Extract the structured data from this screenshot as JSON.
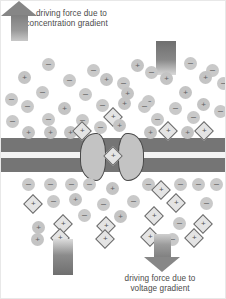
{
  "figure": {
    "labels": {
      "top": {
        "line1": "driving force due to",
        "line2_prefix": "K",
        "line2_superscript": "+",
        "line2_rest": " concentration gradient"
      },
      "bottom": {
        "line1": "driving force due to",
        "line2": "voltage gradient"
      }
    },
    "colors": {
      "membrane": "#757575",
      "membrane_gap": "#f4f4f4",
      "protein_lobe": "#c3c3c3",
      "protein_outline": "#4a4a4a",
      "arrow": "#878787",
      "negative_ion": "#c9c9c9",
      "positive_ion": "#c4c4c4",
      "potassium_ion": "#e4e4e4",
      "text": "#4b4b4b",
      "background": "#ffffff"
    },
    "arrows": [
      {
        "name": "concentration-gradient-arrow",
        "direction": "up",
        "position": "top-left",
        "x": 50,
        "y": 39
      },
      {
        "name": "concentration-gradient-tail",
        "direction": "up",
        "position": "top-right",
        "x": 155,
        "y": 40
      },
      {
        "name": "voltage-gradient-tail",
        "direction": "down",
        "position": "bottom-left",
        "x": 52,
        "y": 238
      },
      {
        "name": "voltage-gradient-arrow",
        "direction": "down",
        "position": "bottom-right",
        "x": 142,
        "y": 233
      }
    ],
    "membrane": {
      "name": "lipid-bilayer",
      "top": 137,
      "height": 36,
      "leaflet_height": 14
    },
    "channel": {
      "name": "potassium-channel-protein",
      "left_lobe": {
        "x": 79,
        "y": 132,
        "w": 26,
        "h": 48
      },
      "right_lobe": {
        "x": 117,
        "y": 132,
        "w": 26,
        "h": 48
      },
      "pore_center_x": 111
    },
    "ion_glyphs": {
      "negative": "–",
      "positive": "+",
      "potassium": "+"
    },
    "ion_legend": [
      {
        "type": "negative",
        "shape": "circle",
        "sign": "–",
        "meaning": "anion"
      },
      {
        "type": "positive",
        "shape": "circle",
        "sign": "+",
        "meaning": "cation"
      },
      {
        "type": "potassium",
        "shape": "diamond",
        "sign": "+",
        "meaning": "K+ ion"
      }
    ],
    "ions": [
      {
        "t": "neg",
        "x": 41,
        "y": 57
      },
      {
        "t": "neg",
        "x": 86,
        "y": 63
      },
      {
        "t": "pos",
        "x": 130,
        "y": 58
      },
      {
        "t": "neg",
        "x": 144,
        "y": 65
      },
      {
        "t": "neg",
        "x": 183,
        "y": 56
      },
      {
        "t": "neg",
        "x": 205,
        "y": 63
      },
      {
        "t": "pos",
        "x": 17,
        "y": 70
      },
      {
        "t": "neg",
        "x": 62,
        "y": 73
      },
      {
        "t": "pos",
        "x": 99,
        "y": 72
      },
      {
        "t": "neg",
        "x": 116,
        "y": 76
      },
      {
        "t": "pos",
        "x": 159,
        "y": 71
      },
      {
        "t": "pos",
        "x": 198,
        "y": 70
      },
      {
        "t": "neg",
        "x": 216,
        "y": 76
      },
      {
        "t": "neg",
        "x": 35,
        "y": 85
      },
      {
        "t": "neg",
        "x": 78,
        "y": 87
      },
      {
        "t": "pos",
        "x": 120,
        "y": 86
      },
      {
        "t": "pos",
        "x": 178,
        "y": 85
      },
      {
        "t": "neg",
        "x": 4,
        "y": 92
      },
      {
        "t": "neg",
        "x": 141,
        "y": 94
      },
      {
        "t": "neg",
        "x": 20,
        "y": 99
      },
      {
        "t": "pos",
        "x": 57,
        "y": 101
      },
      {
        "t": "neg",
        "x": 95,
        "y": 98
      },
      {
        "t": "pos",
        "x": 117,
        "y": 96
      },
      {
        "t": "neg",
        "x": 137,
        "y": 99
      },
      {
        "t": "neg",
        "x": 168,
        "y": 101
      },
      {
        "t": "pos",
        "x": 196,
        "y": 97
      },
      {
        "t": "neg",
        "x": 213,
        "y": 104
      },
      {
        "t": "neg",
        "x": 41,
        "y": 112
      },
      {
        "t": "neg",
        "x": 75,
        "y": 113
      },
      {
        "t": "kion",
        "x": 105,
        "y": 109
      },
      {
        "t": "neg",
        "x": 150,
        "y": 112
      },
      {
        "t": "neg",
        "x": 186,
        "y": 110
      },
      {
        "t": "neg",
        "x": 5,
        "y": 114
      },
      {
        "t": "pos",
        "x": 21,
        "y": 125
      },
      {
        "t": "pos",
        "x": 43,
        "y": 125
      },
      {
        "t": "pos",
        "x": 63,
        "y": 125
      },
      {
        "t": "kion",
        "x": 74,
        "y": 123
      },
      {
        "t": "neg",
        "x": 93,
        "y": 120
      },
      {
        "t": "pos",
        "x": 112,
        "y": 118
      },
      {
        "t": "pos",
        "x": 143,
        "y": 125
      },
      {
        "t": "kion",
        "x": 160,
        "y": 123
      },
      {
        "t": "pos",
        "x": 180,
        "y": 125
      },
      {
        "t": "kion",
        "x": 196,
        "y": 123
      },
      {
        "t": "kion",
        "x": 105,
        "y": 148
      },
      {
        "t": "neg",
        "x": 21,
        "y": 177
      },
      {
        "t": "neg",
        "x": 43,
        "y": 177
      },
      {
        "t": "neg",
        "x": 64,
        "y": 177
      },
      {
        "t": "neg",
        "x": 82,
        "y": 177
      },
      {
        "t": "pos",
        "x": 105,
        "y": 181
      },
      {
        "t": "neg",
        "x": 141,
        "y": 177
      },
      {
        "t": "kion",
        "x": 153,
        "y": 182
      },
      {
        "t": "neg",
        "x": 173,
        "y": 177
      },
      {
        "t": "neg",
        "x": 191,
        "y": 177
      },
      {
        "t": "neg",
        "x": 209,
        "y": 177
      },
      {
        "t": "kion",
        "x": 25,
        "y": 196
      },
      {
        "t": "neg",
        "x": 46,
        "y": 194
      },
      {
        "t": "pos",
        "x": 68,
        "y": 192
      },
      {
        "t": "neg",
        "x": 96,
        "y": 197
      },
      {
        "t": "neg",
        "x": 126,
        "y": 194
      },
      {
        "t": "kion",
        "x": 168,
        "y": 195
      },
      {
        "t": "neg",
        "x": 199,
        "y": 196
      },
      {
        "t": "neg",
        "x": 77,
        "y": 208
      },
      {
        "t": "pos",
        "x": 113,
        "y": 209
      },
      {
        "t": "kion",
        "x": 146,
        "y": 208
      },
      {
        "t": "kion",
        "x": 55,
        "y": 216
      },
      {
        "t": "kion",
        "x": 98,
        "y": 218
      },
      {
        "t": "neg",
        "x": 172,
        "y": 216
      },
      {
        "t": "kion",
        "x": 195,
        "y": 216
      },
      {
        "t": "pos",
        "x": 31,
        "y": 220
      },
      {
        "t": "pos",
        "x": 30,
        "y": 232
      },
      {
        "t": "kion",
        "x": 52,
        "y": 230
      },
      {
        "t": "kion",
        "x": 97,
        "y": 231
      },
      {
        "t": "kion",
        "x": 142,
        "y": 229
      },
      {
        "t": "neg",
        "x": 165,
        "y": 232
      },
      {
        "t": "kion",
        "x": 186,
        "y": 230
      }
    ]
  }
}
